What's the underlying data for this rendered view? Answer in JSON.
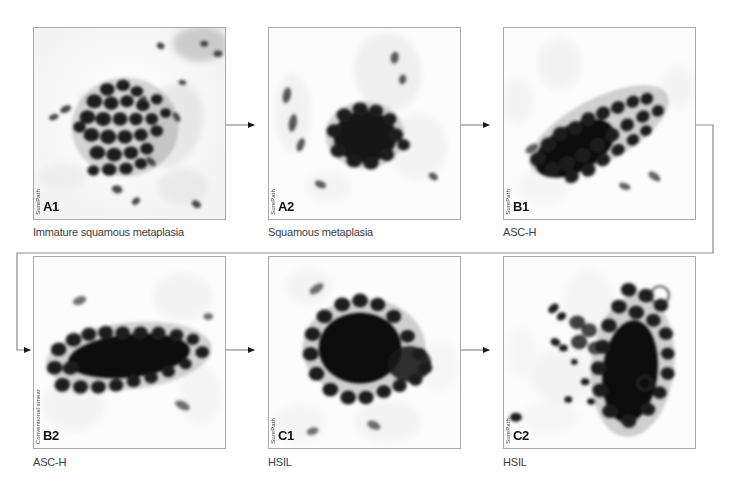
{
  "figure": {
    "type": "cytology-progression-figure",
    "background_color": "#ffffff",
    "panel_border_color": "#a8a8a8",
    "connector_color": "#8a8a8a",
    "caption_color": "#3d3d3d"
  },
  "panels": [
    {
      "id": "A1",
      "label": "A1",
      "caption": "Immature squamous metaplasia",
      "watermark": "SurePath",
      "preparation": "SurePath"
    },
    {
      "id": "A2",
      "label": "A2",
      "caption": "Squamous metaplasia",
      "watermark": "SurePath",
      "preparation": "SurePath"
    },
    {
      "id": "B1",
      "label": "B1",
      "caption": "ASC-H",
      "watermark": "SurePath",
      "preparation": "SurePath"
    },
    {
      "id": "B2",
      "label": "B2",
      "caption": "ASC-H",
      "watermark": "Conventional smear",
      "preparation": "Conventional smear"
    },
    {
      "id": "C1",
      "label": "C1",
      "caption": "HSIL",
      "watermark": "SurePath",
      "preparation": "SurePath"
    },
    {
      "id": "C2",
      "label": "C2",
      "caption": "HSIL",
      "watermark": "SurePath",
      "preparation": "SurePath"
    }
  ],
  "flow": {
    "order": [
      "A1",
      "A2",
      "B1",
      "B2",
      "C1",
      "C2"
    ],
    "arrows": [
      {
        "from": "A1",
        "to": "A2",
        "style": "straight-right"
      },
      {
        "from": "A2",
        "to": "B1",
        "style": "straight-right"
      },
      {
        "from": "B1",
        "to": "B2",
        "style": "wrap-around-right-to-left"
      },
      {
        "from": "B2",
        "to": "C1",
        "style": "straight-right"
      },
      {
        "from": "C1",
        "to": "C2",
        "style": "straight-right"
      }
    ]
  }
}
